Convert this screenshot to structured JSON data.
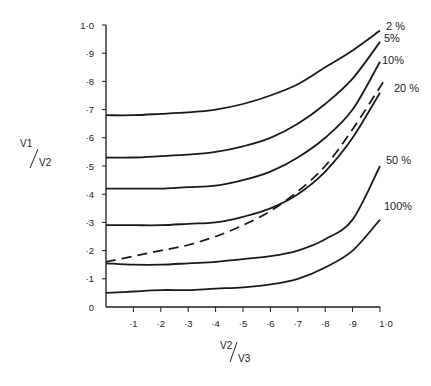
{
  "chart_data": {
    "type": "line",
    "title": "",
    "xlabel": "V2 / V3",
    "ylabel": "V1 / V2",
    "xlim": [
      0,
      1.0
    ],
    "ylim": [
      0,
      1.0
    ],
    "grid": false,
    "legend_position": "inline labels at right end of curves",
    "x": [
      0,
      0.1,
      0.2,
      0.3,
      0.4,
      0.5,
      0.6,
      0.7,
      0.8,
      0.9,
      1.0
    ],
    "x_tick_labels": [
      "·1",
      "·2",
      "·3",
      "·4",
      "·5",
      "·6",
      "·7",
      "·8",
      "·9",
      "1·0"
    ],
    "y_tick_labels": [
      "0",
      "·1",
      "·2",
      "·3",
      "·4",
      "·5",
      "·6",
      "·7",
      "·8",
      "·9",
      "1·0"
    ],
    "series": [
      {
        "name": "2%",
        "label": "2 %",
        "style": "solid",
        "values": [
          0.68,
          0.68,
          0.685,
          0.69,
          0.7,
          0.72,
          0.75,
          0.79,
          0.85,
          0.91,
          0.98
        ]
      },
      {
        "name": "5%",
        "label": "5%",
        "style": "solid",
        "values": [
          0.53,
          0.53,
          0.535,
          0.54,
          0.55,
          0.57,
          0.6,
          0.65,
          0.72,
          0.81,
          0.94
        ]
      },
      {
        "name": "10%",
        "label": "10%",
        "style": "solid",
        "values": [
          0.42,
          0.42,
          0.42,
          0.425,
          0.43,
          0.45,
          0.48,
          0.53,
          0.6,
          0.7,
          0.87
        ]
      },
      {
        "name": "20%",
        "label": "20 %",
        "style": "solid",
        "values": [
          0.29,
          0.29,
          0.29,
          0.295,
          0.3,
          0.32,
          0.35,
          0.4,
          0.48,
          0.6,
          0.76
        ]
      },
      {
        "name": "50%",
        "label": "50 %",
        "style": "solid",
        "values": [
          0.155,
          0.15,
          0.15,
          0.155,
          0.16,
          0.17,
          0.18,
          0.2,
          0.24,
          0.31,
          0.5
        ]
      },
      {
        "name": "100%",
        "label": "100%",
        "style": "solid",
        "values": [
          0.05,
          0.055,
          0.06,
          0.06,
          0.065,
          0.07,
          0.08,
          0.1,
          0.14,
          0.2,
          0.31
        ]
      },
      {
        "name": "dashed",
        "label": "",
        "style": "dashed",
        "values": [
          0.16,
          0.18,
          0.2,
          0.22,
          0.25,
          0.29,
          0.34,
          0.41,
          0.5,
          0.63,
          0.81
        ]
      }
    ]
  },
  "axes": {
    "x_title_num": "V2",
    "x_title_den": "V3",
    "y_title_num": "V1",
    "y_title_den": "V2"
  },
  "colors": {
    "ink": "#1a1a1a",
    "background": "#ffffff"
  }
}
